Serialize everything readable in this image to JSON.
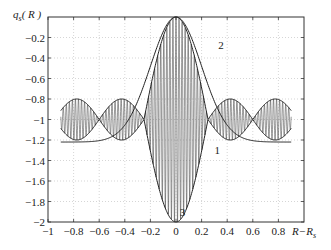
{
  "chart_data": {
    "type": "line",
    "title": "",
    "xlabel": "R−R_s",
    "ylabel": "q_s(R)",
    "xlim": [
      -1,
      1
    ],
    "ylim": [
      -2,
      0
    ],
    "grid": true,
    "x_ticks": [
      "-1",
      "-0.8",
      "-0.6",
      "-0.4",
      "-0.2",
      "0",
      "0.2",
      "0.4",
      "0.6",
      "0.8"
    ],
    "y_ticks": [
      "-0.2",
      "-0.4",
      "-0.6",
      "-0.8",
      "-1",
      "-1.2",
      "-1.4",
      "-1.6",
      "-1.8",
      "-2"
    ],
    "series": [
      {
        "name": "1",
        "description": "Envelope curves oscillating about -1, nodes near x=±0.25 and ±0.6, range -0.8 to -1.22",
        "x": [
          -0.9,
          -0.75,
          -0.6,
          -0.42,
          -0.25,
          -0.1,
          0,
          0.1,
          0.25,
          0.42,
          0.6,
          0.75,
          0.9
        ],
        "upper": [
          -1.0,
          -0.83,
          -1.0,
          -0.8,
          -1.0,
          -0.2,
          0.0,
          -0.2,
          -1.0,
          -0.8,
          -1.0,
          -0.83,
          -1.0
        ],
        "lower": [
          -1.0,
          -1.2,
          -1.0,
          -1.2,
          -1.0,
          -1.8,
          -2.0,
          -1.8,
          -1.0,
          -1.2,
          -1.0,
          -1.2,
          -1.0
        ]
      },
      {
        "name": "2",
        "description": "Gaussian-like curve peaking at 0 at x=0",
        "x": [
          -0.9,
          -0.7,
          -0.5,
          -0.3,
          -0.15,
          0,
          0.15,
          0.3,
          0.5,
          0.7,
          0.9
        ],
        "values": [
          -1.21,
          -1.12,
          -0.85,
          -0.38,
          -0.1,
          0.0,
          -0.1,
          -0.38,
          -0.85,
          -1.12,
          -1.21
        ]
      },
      {
        "name": "3",
        "description": "Rapid oscillation filling envelope of curve 1",
        "x_range": [
          -0.9,
          0.9
        ],
        "center": -1,
        "center_amplitude": 1.0
      }
    ],
    "annotations": [
      {
        "text": "1",
        "x": 0.3,
        "y": -1.3
      },
      {
        "text": "2",
        "x": 0.33,
        "y": -0.27
      },
      {
        "text": "3",
        "x": 0.03,
        "y": -1.9
      }
    ]
  },
  "axis": {
    "ylabel_q": "q",
    "ylabel_sub": "s",
    "ylabel_arg": "( R )",
    "xlabel_main": "R−R",
    "xlabel_sub": "s"
  }
}
